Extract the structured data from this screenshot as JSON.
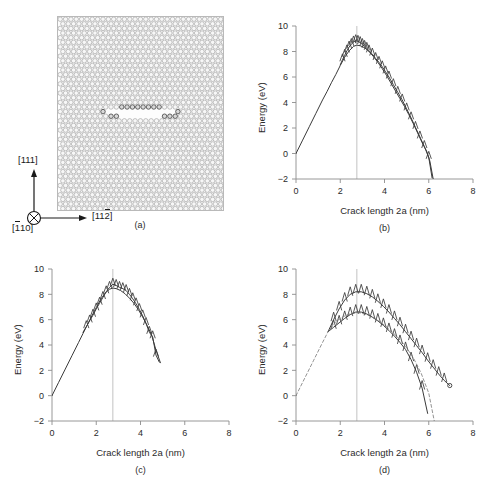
{
  "figure": {
    "panels": [
      {
        "id": "a",
        "caption": "(a)"
      },
      {
        "id": "b",
        "caption": "(b)"
      },
      {
        "id": "c",
        "caption": "(c)"
      },
      {
        "id": "d",
        "caption": "(d)"
      }
    ]
  },
  "panel_a": {
    "caption": "(a)",
    "axes_triad": {
      "vertical_label": "[111]",
      "horizontal_label_pre": "[11",
      "horizontal_label_over": "2",
      "horizontal_label_post": "]",
      "out_of_page_label_pre": "[",
      "out_of_page_label_over": "1",
      "out_of_page_label_post": "10]",
      "out_of_page_symbol": "circle-x-icon"
    },
    "atom_color": "#f7f7f7",
    "atom_stroke": "#9a9a9a",
    "crack_face_color": "#4a4a4a"
  },
  "chart_data": [
    {
      "id": "b",
      "type": "line",
      "caption": "(b)",
      "title": "",
      "xlabel": "Crack length 2a (nm)",
      "ylabel": "Energy (eV)",
      "xlim": [
        0,
        8
      ],
      "ylim": [
        -2,
        10
      ],
      "xticks": [
        0,
        2,
        4,
        6,
        8
      ],
      "yticks": [
        -2,
        0,
        2,
        4,
        6,
        8,
        10
      ],
      "grid": false,
      "vline_x": 2.75,
      "series": [
        {
          "name": "loading-unloading path",
          "marker_end": "none",
          "x": [
            0.0,
            0.3,
            0.6,
            0.9,
            1.2,
            1.4,
            1.6,
            1.8,
            2.0,
            2.2,
            2.4,
            2.6,
            2.75,
            2.9,
            3.1,
            3.3,
            3.5,
            3.7,
            3.9,
            4.1,
            4.3,
            4.5,
            4.7,
            4.9,
            5.1,
            5.3,
            5.5,
            5.7,
            5.9,
            6.05,
            6.2
          ],
          "y": [
            0.0,
            1.05,
            2.1,
            3.15,
            4.2,
            4.85,
            5.55,
            6.2,
            6.9,
            7.55,
            8.05,
            8.4,
            8.5,
            8.45,
            8.3,
            8.0,
            7.6,
            7.15,
            6.65,
            6.1,
            5.5,
            4.9,
            4.3,
            3.7,
            3.05,
            2.35,
            1.6,
            0.85,
            0.2,
            -0.6,
            -2.0
          ]
        },
        {
          "name": "sawtooth lattice trapping",
          "marker_end": "none",
          "x": [
            2.0,
            2.1,
            2.2,
            2.3,
            2.4,
            2.5,
            2.6,
            2.7,
            2.8,
            2.9,
            3.0,
            3.1,
            3.2,
            3.3,
            3.45,
            3.6,
            3.75,
            3.9,
            4.05,
            4.2,
            4.4,
            4.6,
            4.8,
            5.0,
            5.2,
            5.4,
            5.6,
            5.8,
            6.0,
            6.15
          ],
          "y": [
            6.95,
            7.35,
            7.7,
            8.05,
            8.35,
            8.55,
            8.75,
            8.85,
            8.8,
            8.7,
            8.55,
            8.4,
            8.25,
            8.05,
            7.8,
            7.45,
            7.15,
            6.8,
            6.4,
            6.0,
            5.4,
            4.8,
            4.2,
            3.5,
            2.8,
            2.05,
            1.3,
            0.55,
            -0.3,
            -1.9
          ]
        }
      ]
    },
    {
      "id": "c",
      "type": "line",
      "caption": "(c)",
      "title": "",
      "xlabel": "Crack length 2a (nm)",
      "ylabel": "Energy (eV)",
      "xlim": [
        0,
        8
      ],
      "ylim": [
        -2,
        10
      ],
      "xticks": [
        0,
        2,
        4,
        6,
        8
      ],
      "yticks": [
        -2,
        0,
        2,
        4,
        6,
        8,
        10
      ],
      "grid": false,
      "vline_x": 2.75,
      "series": [
        {
          "name": "loading path",
          "marker_end": "none",
          "x": [
            0.0,
            0.3,
            0.6,
            0.9,
            1.2,
            1.4,
            1.6,
            1.8,
            2.0,
            2.2,
            2.4,
            2.6,
            2.75,
            2.9,
            3.1,
            3.3,
            3.5,
            3.7,
            3.9,
            4.1,
            4.3,
            4.5,
            4.7,
            4.9
          ],
          "y": [
            0.0,
            1.05,
            2.1,
            3.15,
            4.2,
            4.9,
            5.6,
            6.3,
            6.95,
            7.6,
            8.1,
            8.4,
            8.5,
            8.45,
            8.3,
            8.05,
            7.7,
            7.3,
            6.8,
            6.2,
            5.55,
            4.8,
            3.6,
            2.6
          ]
        },
        {
          "name": "sawtooth lattice trapping",
          "marker_end": "none",
          "x": [
            1.4,
            1.55,
            1.7,
            1.85,
            2.0,
            2.15,
            2.3,
            2.45,
            2.6,
            2.75,
            2.9,
            3.05,
            3.2,
            3.35,
            3.5,
            3.65,
            3.8,
            3.95,
            4.1,
            4.25,
            4.4,
            4.55,
            4.7,
            4.85
          ],
          "y": [
            5.0,
            5.45,
            5.9,
            6.35,
            6.85,
            7.3,
            7.75,
            8.2,
            8.55,
            8.8,
            8.7,
            8.55,
            8.45,
            8.3,
            8.0,
            7.65,
            7.25,
            6.8,
            6.3,
            5.7,
            5.0,
            4.65,
            3.2,
            2.65
          ]
        }
      ]
    },
    {
      "id": "d",
      "type": "line",
      "caption": "(d)",
      "title": "",
      "xlabel": "Crack length 2a (nm)",
      "ylabel": "Energy (eV)",
      "xlim": [
        0,
        8
      ],
      "ylim": [
        -2,
        10
      ],
      "xticks": [
        0,
        2,
        4,
        6,
        8
      ],
      "yticks": [
        -2,
        0,
        2,
        4,
        6,
        8,
        10
      ],
      "grid": false,
      "vline_x": 2.75,
      "series": [
        {
          "name": "upper branch",
          "marker_end": "open-circle",
          "x": [
            1.45,
            1.7,
            1.95,
            2.2,
            2.45,
            2.7,
            2.95,
            3.2,
            3.45,
            3.7,
            3.95,
            4.2,
            4.45,
            4.7,
            4.95,
            5.2,
            5.45,
            5.7,
            5.95,
            6.2,
            6.45,
            6.7,
            6.95
          ],
          "y": [
            5.05,
            6.0,
            6.85,
            7.55,
            8.0,
            8.2,
            8.2,
            8.05,
            7.8,
            7.45,
            7.05,
            6.6,
            6.1,
            5.6,
            5.05,
            4.5,
            3.95,
            3.4,
            2.8,
            2.25,
            1.7,
            1.2,
            0.8
          ]
        },
        {
          "name": "lower branch",
          "marker_end": "none",
          "x": [
            1.45,
            1.7,
            1.95,
            2.2,
            2.45,
            2.7,
            2.95,
            3.2,
            3.45,
            3.7,
            3.95,
            4.2,
            4.45,
            4.7,
            4.95,
            5.2,
            5.45,
            5.7,
            5.95
          ],
          "y": [
            5.05,
            5.4,
            5.75,
            6.1,
            6.4,
            6.6,
            6.6,
            6.45,
            6.2,
            5.9,
            5.55,
            5.15,
            4.7,
            4.2,
            3.65,
            2.85,
            1.85,
            0.6,
            -1.4
          ]
        },
        {
          "name": "dashed reference path",
          "marker_end": "none",
          "x": [
            0.0,
            0.4,
            0.8,
            1.2,
            1.45,
            1.8,
            2.15,
            2.5,
            2.85,
            3.2,
            3.55,
            3.9,
            4.25,
            4.6,
            4.95,
            5.3,
            5.65,
            6.0,
            6.25
          ],
          "y": [
            0.0,
            1.4,
            2.8,
            4.2,
            5.05,
            5.85,
            6.25,
            6.5,
            6.55,
            6.4,
            6.1,
            5.7,
            5.2,
            4.6,
            3.9,
            3.0,
            1.8,
            0.2,
            -2.0
          ]
        }
      ]
    }
  ]
}
